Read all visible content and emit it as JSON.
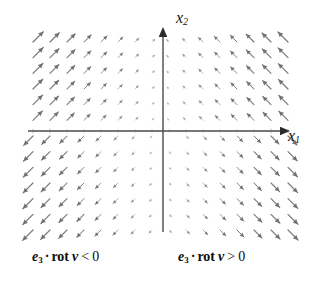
{
  "figure": {
    "kind": "vector-field-plot",
    "background_color": "#ffffff",
    "arrow_color": "#6e6e6e",
    "axis_color": "#4a4a4a"
  },
  "axes": {
    "x_axis": {
      "label_var": "x",
      "label_sub": "1",
      "label_text": "x1",
      "y_pixel": 131,
      "x_start_pixel": 28,
      "x_end_pixel": 285,
      "arrowhead": "right"
    },
    "y_axis": {
      "label_var": "x",
      "label_sub": "2",
      "label_text": "x2",
      "x_pixel": 163,
      "y_start_pixel": 232,
      "y_end_pixel": 30,
      "arrowhead": "up"
    },
    "origin": {
      "x": 163,
      "y": 131
    },
    "ticks_visible": true
  },
  "captions": {
    "left": {
      "e": "e",
      "e_sub": "3",
      "dot": "·",
      "rot": "rot",
      "v": "v",
      "relation": "<",
      "zero": "0",
      "full_text": "e3 · rot v < 0",
      "quadrant": "left-half-plane"
    },
    "right": {
      "e": "e",
      "e_sub": "3",
      "dot": "·",
      "rot": "rot",
      "v": "v",
      "relation": ">",
      "zero": "0",
      "full_text": "e3 · rot v > 0",
      "quadrant": "right-half-plane"
    }
  },
  "chart_data": {
    "type": "scatter",
    "title": "",
    "xlabel": "x1",
    "ylabel": "x2",
    "grid": false,
    "legend": "none",
    "field_description": "Planar vector field of arrows; arrows in the upper-left quadrant point north-east, upper-right point north-west, lower-left point south-west, lower-right point south-east. Arrow length grows with horizontal distance from the vertical axis and with vertical distance from the horizontal axis.",
    "grid_columns": 16,
    "grid_rows": 13,
    "grid_x_min_pixel": 33,
    "grid_x_max_pixel": 288,
    "grid_y_min_pixel": 42,
    "grid_y_max_pixel": 230,
    "vector_formula": "v = (-x2*f, x1*f) style shear, magnitude proportional to |x1|",
    "xlim": [
      -8,
      8
    ],
    "ylim": [
      -6,
      6
    ],
    "annotations": [
      {
        "text": "e3 · rot v < 0",
        "x": -4,
        "y": -7.2
      },
      {
        "text": "e3 · rot v > 0",
        "x": 3,
        "y": -7.2
      }
    ]
  }
}
